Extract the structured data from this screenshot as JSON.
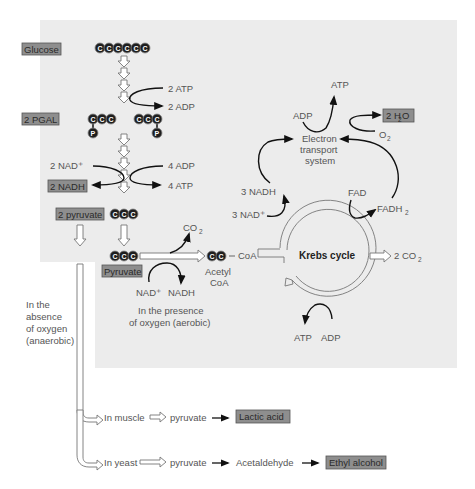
{
  "diagram": {
    "colors": {
      "panel_bg": "#ececec",
      "label_box": "#8e8e8e",
      "atom": "#1e1e1e",
      "arrow": "#111111"
    },
    "glycolysis": {
      "glucose_label": "Glucose",
      "glucose_atoms": [
        "C",
        "C",
        "C",
        "C",
        "C",
        "C"
      ],
      "atp_in": "2 ATP",
      "adp_out": "2 ADP",
      "pgal_label": "2 PGAL",
      "pgal_atoms": [
        "C",
        "C",
        "C"
      ],
      "phosphate": "P",
      "nad_in": "2 NAD⁺",
      "nadh_label": "2 NADH",
      "adp_in": "4 ADP",
      "atp_out": "4 ATP",
      "pyruvate_label": "2 pyruvate",
      "pyruvate_atoms": [
        "C",
        "C",
        "C"
      ]
    },
    "aerobic": {
      "pyruvate_label": "Pyruvate",
      "co2": "CO",
      "co2_sub": "2",
      "nad": "NAD⁺",
      "nadh": "NADH",
      "acetyl_atoms": [
        "C",
        "C"
      ],
      "coa": "CoA",
      "acetyl_label_1": "Acetyl",
      "acetyl_label_2": "CoA",
      "caption_1": "In the presence",
      "caption_2": "of oxygen (aerobic)"
    },
    "krebs": {
      "label": "Krebs cycle",
      "nad_in": "3 NAD⁺",
      "nadh_out": "3 NADH",
      "fad_in": "FAD",
      "fadh_out": "FADH",
      "fadh_sub": "2",
      "co2_out": "2 CO",
      "co2_sub": "2",
      "atp_out": "ATP",
      "adp_in": "ADP"
    },
    "ets": {
      "label_1": "Electron",
      "label_2": "transport",
      "label_3": "system",
      "atp_out": "ATP",
      "adp_in": "ADP",
      "o2": "O",
      "o2_sub": "2",
      "water_label": "2 H",
      "water_sub": "2",
      "water_o": "O"
    },
    "anaerobic": {
      "caption_1": "In the",
      "caption_2": "absence",
      "caption_3": "of oxygen",
      "caption_4": "(anaerobic)",
      "muscle": "In muscle",
      "muscle_pyruvate": "pyruvate",
      "muscle_product": "Lactic acid",
      "yeast": "In yeast",
      "yeast_pyruvate": "pyruvate",
      "yeast_intermediate": "Acetaldehyde",
      "yeast_product": "Ethyl alcohol"
    }
  }
}
